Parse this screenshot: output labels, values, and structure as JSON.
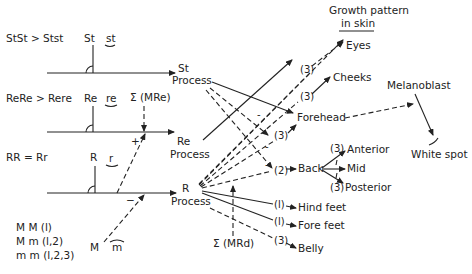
{
  "genes": {
    "st": {
      "dominance": "StSt > Stst",
      "dominant": "St",
      "recessive": "st",
      "process": [
        "St",
        "Process"
      ]
    },
    "re": {
      "dominance": "ReRe > Rere",
      "dominant": "Re",
      "recessive": "re",
      "modifier": "Σ (MRe)",
      "process": [
        "Re",
        "Process"
      ]
    },
    "r": {
      "dominance": "RR = Rr",
      "dominant": "R",
      "recessive": "r",
      "process": [
        "R",
        "Process"
      ]
    },
    "m": {
      "genotypes": [
        "M M (l)",
        "M m (l,2)",
        "m m (l,2,3)"
      ],
      "dominant": "M",
      "recessive": "m"
    }
  },
  "signs": {
    "plus": "+",
    "minus": "−",
    "minor_minus": "-"
  },
  "modifier_rd": "Σ (MRd)",
  "header": {
    "line1": "Growth pattern",
    "line2": "in skin"
  },
  "targets": {
    "eyes": "Eyes",
    "cheeks": "Cheeks",
    "forehead": "Forehead",
    "back": "Back",
    "anterior": "Anterior",
    "mid": "Mid",
    "posterior": "Posterior",
    "hind_feet": "Hind feet",
    "fore_feet": "Fore feet",
    "belly": "Belly"
  },
  "weights": {
    "eyes": "(3)",
    "cheeks": "(3)",
    "forehead": "(3)",
    "back": "(2)",
    "anterior": "(3)",
    "posterior": "(3)",
    "hind_feet": "(l)",
    "fore_feet": "(l)",
    "belly": "(3)"
  },
  "melanoblast": "Melanoblast",
  "white_spot": "White spot"
}
